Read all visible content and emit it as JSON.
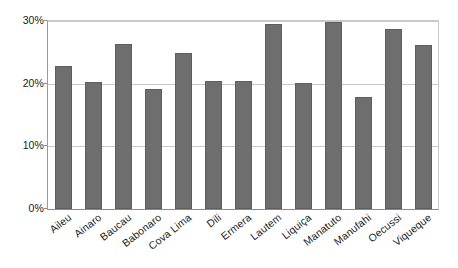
{
  "chart_data": {
    "type": "bar",
    "title": "",
    "subtitle": "",
    "xlabel": "",
    "ylabel": "",
    "categories": [
      "Aileu",
      "Ainaro",
      "Baucau",
      "Babonaro",
      "Cova Lima",
      "Dili",
      "Ermera",
      "Lautem",
      "Liquiça",
      "Manatuto",
      "Manufahi",
      "Oecussi",
      "Viqueque"
    ],
    "values": [
      22.9,
      20.3,
      26.3,
      19.2,
      24.9,
      20.4,
      20.4,
      29.5,
      20.1,
      29.9,
      17.8,
      28.8,
      26.1
    ],
    "value_labels": [
      "",
      "",
      "",
      "",
      "",
      "",
      "",
      "",
      "",
      "",
      "",
      "",
      ""
    ],
    "ylim": [
      0,
      30
    ],
    "y_ticks": [
      0,
      10,
      20,
      30
    ],
    "y_tick_labels": [
      "0%",
      "10%",
      "20%",
      "30%"
    ],
    "grid": true,
    "grid_axis": "y",
    "legend": false,
    "legend_position": "none",
    "bar_color": "#6e6e6e",
    "bar_edge_color": "#5e5e5e",
    "gridline_color": "#c9c9c9",
    "axis_color": "#8a8a8a",
    "text_color": "#1a1a1a",
    "background_color": "#ffffff",
    "x_tick_rotation": -38
  }
}
